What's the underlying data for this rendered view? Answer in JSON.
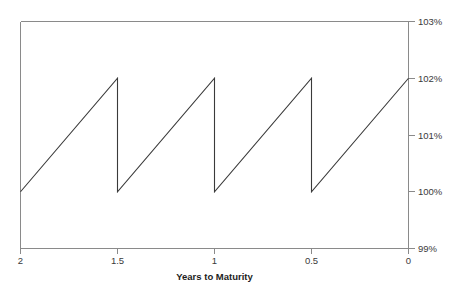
{
  "chart_data": {
    "type": "line",
    "title": "",
    "subtitle": "",
    "xlabel": "Years to Maturity",
    "ylabel": "",
    "xlim": [
      2,
      0
    ],
    "ylim": [
      99,
      103
    ],
    "x_reversed": true,
    "grid": false,
    "legend": false,
    "legend_position": "none",
    "y_axis_side": "right",
    "x_ticks": [
      "2",
      "1.5",
      "1",
      "0.5",
      "0"
    ],
    "x_tick_values": [
      2,
      1.5,
      1,
      0.5,
      0
    ],
    "y_ticks": [
      "99%",
      "100%",
      "101%",
      "102%",
      "103%"
    ],
    "y_tick_values": [
      99,
      100,
      101,
      102,
      103
    ],
    "series": [
      {
        "name": "Dirty Price",
        "color": "#3a3a3a",
        "points": [
          {
            "x": 2.0,
            "y": 100.0
          },
          {
            "x": 1.5,
            "y": 102.0
          },
          {
            "x": 1.5,
            "y": 100.0
          },
          {
            "x": 1.0,
            "y": 102.0
          },
          {
            "x": 1.0,
            "y": 100.0
          },
          {
            "x": 0.5,
            "y": 102.0
          },
          {
            "x": 0.5,
            "y": 100.0
          },
          {
            "x": 0.0,
            "y": 102.0
          }
        ]
      }
    ],
    "annotations": []
  },
  "axes": {
    "x_axis_label": "Years to Maturity",
    "tick_label_x_0": "2",
    "tick_label_x_1": "1.5",
    "tick_label_x_2": "1",
    "tick_label_x_3": "0.5",
    "tick_label_x_4": "0",
    "tick_label_y_0": "99%",
    "tick_label_y_1": "100%",
    "tick_label_y_2": "101%",
    "tick_label_y_3": "102%",
    "tick_label_y_4": "103%"
  },
  "colors": {
    "series": "#3a3a3a",
    "axis": "#8a8a8a",
    "text": "#2b2b2b",
    "background": "#ffffff"
  }
}
